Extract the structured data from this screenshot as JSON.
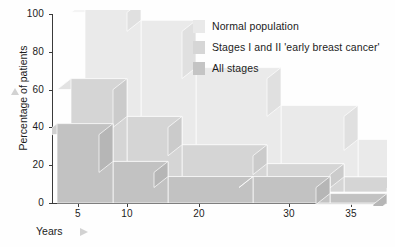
{
  "chart_data": {
    "type": "area",
    "title": "",
    "xlabel": "Years",
    "ylabel": "Percentage of patients",
    "categories": [
      "5",
      "10",
      "20",
      "30",
      "35"
    ],
    "xticklabels": [
      "5",
      "10",
      "20",
      "30",
      "35"
    ],
    "yticklabels": [
      "0",
      "20",
      "40",
      "60",
      "80",
      "100"
    ],
    "ylim": [
      0,
      100
    ],
    "yticks": [
      0,
      20,
      40,
      60,
      80,
      100
    ],
    "grid": false,
    "legend_position": "top-right",
    "style": "3d-stepped-bars",
    "series": [
      {
        "name": "Normal population",
        "color": "#eeeeee",
        "values": [
          95,
          85,
          60,
          40,
          22
        ]
      },
      {
        "name": "Stages I and II 'early breast cancer'",
        "color": "#d8d8d8",
        "values": [
          60,
          40,
          25,
          15,
          8
        ]
      },
      {
        "name": "All stages",
        "color": "#c6c6c6",
        "values": [
          42,
          22,
          14,
          14,
          5
        ]
      }
    ]
  },
  "legend": {
    "items": [
      {
        "label": "Normal population",
        "color": "#e9e9e9"
      },
      {
        "label": "Stages I and II 'early breast cancer'",
        "color": "#d6d6d6"
      },
      {
        "label": "All stages",
        "color": "#c4c4c4"
      }
    ]
  },
  "axes": {
    "y_axis_title": "Percentage of patients",
    "x_axis_title": "Years"
  }
}
